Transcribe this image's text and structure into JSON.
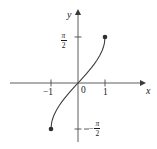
{
  "figure": {
    "background_color": "#ffffff",
    "ink_color": "#3a3a3a",
    "text_color": "#1a1a1a",
    "width": 157,
    "height": 149
  },
  "axes": {
    "x_axis_label": "x",
    "y_axis_label": "y",
    "origin_label": "0",
    "x_ticks": [
      {
        "label": "−1",
        "value": -1
      },
      {
        "label": "1",
        "value": 1
      }
    ],
    "y_ticks": [
      {
        "numerator": "π",
        "denominator": "2",
        "sign": "",
        "value": 1.5708
      },
      {
        "numerator": "π",
        "denominator": "2",
        "sign": "−",
        "value": -1.5708
      }
    ]
  },
  "chart_data": {
    "type": "line",
    "title": "",
    "xlabel": "x",
    "ylabel": "y",
    "xlim": [
      -1.45,
      2.4
    ],
    "ylim": [
      -2.05,
      2.2
    ],
    "grid": false,
    "legend": null,
    "function": "y = arcsin(x)",
    "domain": [
      -1,
      1
    ],
    "range": [
      -1.5708,
      1.5708
    ],
    "endpoints_closed": true,
    "series": [
      {
        "name": "arcsin(x)",
        "x": [
          -1.0,
          -0.98,
          -0.95,
          -0.9,
          -0.8,
          -0.7,
          -0.6,
          -0.5,
          -0.4,
          -0.3,
          -0.2,
          -0.1,
          0.0,
          0.1,
          0.2,
          0.3,
          0.4,
          0.5,
          0.6,
          0.7,
          0.8,
          0.9,
          0.95,
          0.98,
          1.0
        ],
        "y": [
          -1.5708,
          -1.3709,
          -1.2532,
          -1.1198,
          -0.9273,
          -0.7754,
          -0.6435,
          -0.5236,
          -0.4115,
          -0.3047,
          -0.2014,
          -0.1002,
          0.0,
          0.1002,
          0.2014,
          0.3047,
          0.4115,
          0.5236,
          0.6435,
          0.7754,
          0.9273,
          1.1198,
          1.2532,
          1.3709,
          1.5708
        ]
      }
    ],
    "markers": [
      {
        "name": "upper-endpoint",
        "x": 1.0,
        "y": 1.5708,
        "style": "filled-circle"
      },
      {
        "name": "lower-endpoint",
        "x": -1.0,
        "y": -1.5708,
        "style": "filled-circle"
      }
    ]
  }
}
